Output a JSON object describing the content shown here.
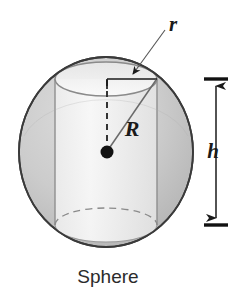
{
  "figure": {
    "caption": "Sphere",
    "labels": {
      "radius_small": "r",
      "radius_large": "R",
      "height": "h"
    },
    "colors": {
      "sphere_fill": "#c9c9c9",
      "sphere_stroke": "#3a3a3a",
      "cylinder_fill": "#f0f0f0",
      "cylinder_stroke": "#8a8a8a",
      "leader_stroke": "#555555",
      "dimension_stroke": "#1a1a1a",
      "text": "#1a1a1a",
      "background": "#ffffff"
    },
    "geometry": {
      "sphere_center_x": 106,
      "sphere_center_y": 152,
      "sphere_radius_x": 87,
      "sphere_radius_y": 95,
      "cylinder_left_x": 55,
      "cylinder_right_x": 157,
      "cylinder_top_y": 79,
      "cylinder_bottom_y": 225,
      "ellipse_ry": 17,
      "center_dot_x": 107,
      "center_dot_y": 152,
      "dimension_x": 215,
      "dimension_top_y": 79,
      "dimension_bottom_y": 225
    },
    "elements": {
      "sphere_name": "sphere-outline",
      "cylinder_name": "inscribed-cylinder",
      "center_dot_name": "sphere-center-point",
      "radius_line_name": "cylinder-radius-line",
      "slant_line_name": "sphere-radius-line",
      "dashed_line_name": "cylinder-half-height-dashed-line",
      "height_dimension_name": "height-dimension-arrow"
    }
  }
}
